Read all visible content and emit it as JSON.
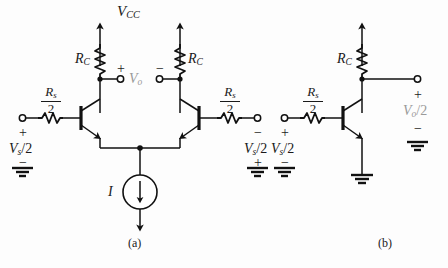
{
  "figure": {
    "caption_a": "(a)",
    "caption_b": "(b)",
    "stroke_color": "#111111",
    "label_color": "#1a1a1a",
    "background": "#fdfdfd"
  },
  "circuit_a": {
    "supply_label": "V",
    "supply_sub": "CC",
    "collector_resistor_left": {
      "label": "R",
      "sub": "C"
    },
    "collector_resistor_right": {
      "label": "R",
      "sub": "C"
    },
    "source_resistor_left": {
      "num_label": "R",
      "num_sub": "s",
      "den": "2"
    },
    "source_resistor_right": {
      "num_label": "R",
      "num_sub": "s",
      "den": "2"
    },
    "input_left": {
      "label": "V",
      "sub": "s",
      "suffix": "/2",
      "sign_top": "+",
      "sign_bottom": "−"
    },
    "input_right": {
      "label": "V",
      "sub": "s",
      "suffix": "/2",
      "sign_top": "−",
      "sign_bottom": "+"
    },
    "output": {
      "label": "V",
      "sub": "o",
      "sign_left": "+",
      "sign_right": "−"
    },
    "current_source": {
      "label": "I"
    },
    "ground_left": "ground-symbol",
    "ground_right": "ground-symbol"
  },
  "circuit_b": {
    "collector_resistor": {
      "label": "R",
      "sub": "C"
    },
    "source_resistor": {
      "num_label": "R",
      "num_sub": "s",
      "den": "2"
    },
    "input": {
      "label": "V",
      "sub": "s",
      "suffix": "/2",
      "sign_top": "+",
      "sign_bottom": "−"
    },
    "output": {
      "label": "V",
      "sub": "o",
      "suffix": "/2",
      "sign_top": "+",
      "sign_bottom": "−"
    },
    "ground_input": "ground-symbol",
    "ground_output": "ground-symbol",
    "ground_emitter": "ground-symbol"
  }
}
